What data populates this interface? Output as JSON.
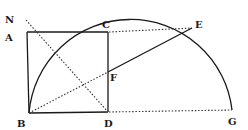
{
  "diagram": {
    "type": "geometric-construction",
    "colors": {
      "ink": "#1a1a1a",
      "background": "#ffffff"
    },
    "points": {
      "N": {
        "label": "N",
        "x": 26,
        "y": 20
      },
      "A": {
        "label": "A",
        "x": 27,
        "y": 32
      },
      "C": {
        "label": "C",
        "x": 108,
        "y": 32
      },
      "E": {
        "label": "E",
        "x": 192,
        "y": 28
      },
      "F": {
        "label": "F",
        "x": 108,
        "y": 72
      },
      "B": {
        "label": "B",
        "x": 29,
        "y": 113
      },
      "D": {
        "label": "D",
        "x": 108,
        "y": 112
      },
      "G": {
        "label": "G",
        "x": 232,
        "y": 110
      }
    },
    "labels": {
      "N": "N",
      "A": "A",
      "C": "C",
      "E": "E",
      "F": "F",
      "B": "B",
      "D": "D",
      "G": "G"
    },
    "elements": [
      {
        "kind": "rectangle",
        "vertices": [
          "A",
          "C",
          "D",
          "B"
        ],
        "style": "solid"
      },
      {
        "kind": "semicircle-arc",
        "from": "B",
        "to": "G",
        "through": "E",
        "style": "solid"
      },
      {
        "kind": "segment",
        "from": "N",
        "to": "D",
        "style": "dotted"
      },
      {
        "kind": "segment",
        "from": "C",
        "to": "E",
        "style": "dotted"
      },
      {
        "kind": "segment",
        "from": "D",
        "to": "G",
        "style": "dotted"
      },
      {
        "kind": "segment",
        "from": "B",
        "to": "F",
        "style": "dotted"
      },
      {
        "kind": "segment",
        "from": "F",
        "to": "E",
        "style": "solid"
      }
    ]
  }
}
